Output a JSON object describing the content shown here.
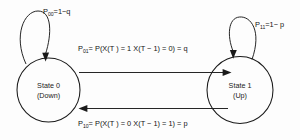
{
  "diagram": {
    "background_color": "#fdfdfd",
    "stroke_color": "#1a1a1a",
    "text_color": "#141414",
    "states": [
      {
        "id": "state-0",
        "line1": "State 0",
        "line2": "(Down)"
      },
      {
        "id": "state-1",
        "line1": "State 1",
        "line2": "(Up)"
      }
    ],
    "transitions": [
      {
        "id": "p00",
        "kind": "self-loop",
        "symbol": "P",
        "subscript": "00",
        "body": "=1−q",
        "full_text": "P00=1−q"
      },
      {
        "id": "p11",
        "kind": "self-loop",
        "symbol": "P",
        "subscript": "11",
        "body": "=1− p",
        "full_text": "P11=1− p"
      },
      {
        "id": "p01",
        "kind": "left-to-right",
        "symbol": "P",
        "subscript": "01",
        "body": "= P(X(T ) = 1 X(T − 1) = 0) = q",
        "full_text": "P01= P(X(T ) = 1 X(T − 1) = 0) = q"
      },
      {
        "id": "p10",
        "kind": "right-to-left",
        "symbol": "P",
        "subscript": "10",
        "body": "= P(X(T ) = 0 X(T − 1) = 1) = p",
        "full_text": "P10= P(X(T ) = 0 X(T − 1) = 1) = p"
      }
    ]
  }
}
